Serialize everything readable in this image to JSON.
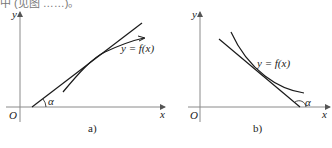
{
  "top_fragment": "中 (见图 ……)。",
  "panels": [
    {
      "id": "a",
      "caption": "a)",
      "y_axis_label": "y",
      "x_axis_label": "x",
      "origin_label": "O",
      "curve_label": "y = f(x)",
      "angle_label": "α",
      "description": "Increasing function; tangent line makes acute angle α with x-axis"
    },
    {
      "id": "b",
      "caption": "b)",
      "y_axis_label": "y",
      "x_axis_label": "x",
      "origin_label": "O",
      "curve_label": "y = f(x)",
      "angle_label": "α",
      "description": "Decreasing function; tangent line makes obtuse angle α with x-axis"
    }
  ],
  "colors": {
    "axis": "#8a8a8a",
    "curve": "#1a1a1a",
    "text": "#222222"
  }
}
